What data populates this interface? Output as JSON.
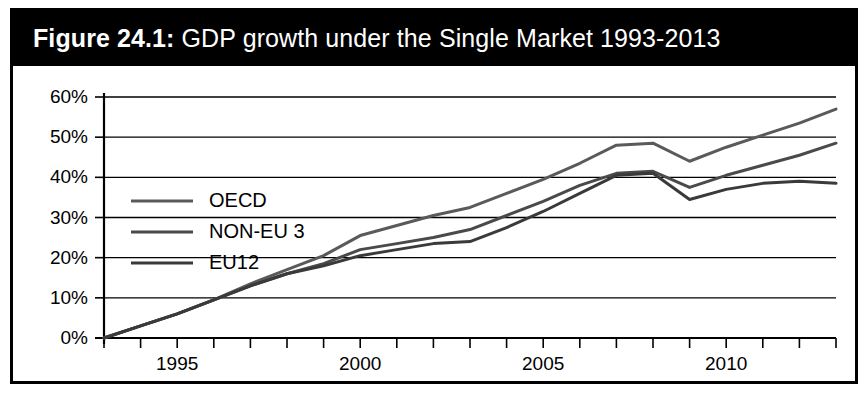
{
  "figure": {
    "label": "Figure 24.1:",
    "title": " GDP growth under the Single Market 1993-2013",
    "frame_color": "#000000",
    "title_bar_color": "#000000",
    "title_text_color": "#ffffff",
    "background_color": "#ffffff"
  },
  "chart_data": {
    "type": "line",
    "title": "Figure 24.1: GDP growth under the Single Market 1993-2013",
    "xlabel": "",
    "ylabel": "",
    "xlim": [
      1993,
      2013
    ],
    "ylim": [
      0,
      60
    ],
    "grid": true,
    "legend_position": "top-left",
    "x": [
      1993,
      1994,
      1995,
      1996,
      1997,
      1998,
      1999,
      2000,
      2001,
      2002,
      2003,
      2004,
      2005,
      2006,
      2007,
      2008,
      2009,
      2010,
      2011,
      2012,
      2013
    ],
    "xtick_labels": [
      "1995",
      "2000",
      "2005",
      "2010"
    ],
    "xtick_values": [
      1995,
      2000,
      2005,
      2010
    ],
    "ytick_labels": [
      "0%",
      "10%",
      "20%",
      "30%",
      "40%",
      "50%",
      "60%"
    ],
    "ytick_values": [
      0,
      10,
      20,
      30,
      40,
      50,
      60
    ],
    "series": [
      {
        "name": "OECD",
        "color": "#5a5a5a",
        "values": [
          0,
          3,
          6,
          9.5,
          13.5,
          17,
          20.5,
          25.5,
          28,
          30.5,
          32.5,
          36,
          39.5,
          43.5,
          48,
          48.5,
          44,
          47.5,
          50.5,
          53.5,
          57
        ]
      },
      {
        "name": "NON-EU 3",
        "color": "#4a4a4a",
        "values": [
          0,
          3,
          6,
          9.5,
          13,
          16,
          18.5,
          22,
          23.5,
          25,
          27,
          30.5,
          34,
          38,
          41,
          41.5,
          37.5,
          40.5,
          43,
          45.5,
          48.5
        ]
      },
      {
        "name": "EU12",
        "color": "#3a3a3a",
        "values": [
          0,
          3,
          6,
          9.5,
          13,
          16,
          18,
          20.5,
          22,
          23.5,
          24,
          27.5,
          31.5,
          36,
          40.5,
          41,
          34.5,
          37,
          38.5,
          39,
          38.5
        ]
      }
    ]
  },
  "legend": {
    "items": [
      {
        "label": "OECD"
      },
      {
        "label": "NON-EU 3"
      },
      {
        "label": "EU12"
      }
    ]
  }
}
